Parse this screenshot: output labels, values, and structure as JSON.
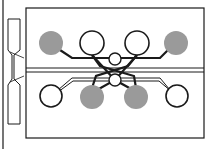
{
  "diagram": {
    "type": "microfluidic-chip-layout",
    "colors": {
      "stroke": "#1a1a1a",
      "filled_pad": "#9a9a9a",
      "open_pad": "#ffffff",
      "background": "#ffffff"
    },
    "pads_top": [
      {
        "x": 51,
        "y": 43,
        "filled": true
      },
      {
        "x": 92,
        "y": 43,
        "filled": false
      },
      {
        "x": 137,
        "y": 43,
        "filled": false
      },
      {
        "x": 176,
        "y": 43,
        "filled": true
      }
    ],
    "pads_bottom": [
      {
        "x": 51,
        "y": 96,
        "filled": false
      },
      {
        "x": 92,
        "y": 96,
        "filled": true
      },
      {
        "x": 136,
        "y": 96,
        "filled": true
      },
      {
        "x": 177,
        "y": 96,
        "filled": false
      }
    ],
    "center_nodes": [
      {
        "x": 115,
        "y": 60
      },
      {
        "x": 115,
        "y": 80
      }
    ]
  }
}
